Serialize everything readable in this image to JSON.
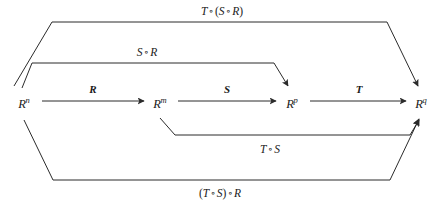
{
  "diagram": {
    "background_color": "#ffffff",
    "stroke_color": "#2b2b2b",
    "nodes": [
      {
        "id": "n1",
        "symbol": "R",
        "superscript": "n",
        "x": 24,
        "y": 103
      },
      {
        "id": "n2",
        "symbol": "R",
        "superscript": "m",
        "x": 160,
        "y": 103
      },
      {
        "id": "n3",
        "symbol": "R",
        "superscript": "p",
        "x": 292,
        "y": 103
      },
      {
        "id": "n4",
        "symbol": "R",
        "superscript": "q",
        "x": 421,
        "y": 103
      }
    ],
    "arrows": [
      {
        "id": "a1",
        "label": "R",
        "x": 93,
        "y": 89
      },
      {
        "id": "a2",
        "label": "S",
        "x": 227,
        "y": 89
      },
      {
        "id": "a3",
        "label": "T",
        "x": 359,
        "y": 89
      }
    ],
    "compositions": [
      {
        "id": "c1",
        "label_parts": {
          "left": "T",
          "op1": "∘",
          "open": "(",
          "mid": "S",
          "op2": "∘",
          "right": "R",
          "close": ")"
        },
        "label_text": "T ∘ (S ∘ R)",
        "x": 222,
        "y": 12
      },
      {
        "id": "c2",
        "label_parts": {
          "left": "S",
          "op1": "∘",
          "right": "R"
        },
        "label_text": "S ∘ R",
        "x": 147,
        "y": 53
      },
      {
        "id": "c3",
        "label_parts": {
          "left": "T",
          "op1": "∘",
          "right": "S"
        },
        "label_text": "T ∘ S",
        "x": 270,
        "y": 150
      },
      {
        "id": "c4",
        "label_parts": {
          "open": "(",
          "left": "T",
          "op1": "∘",
          "mid": "S",
          "close": ")",
          "op2": "∘",
          "right": "R"
        },
        "label_text": "(T ∘ S) ∘ R",
        "x": 220,
        "y": 194
      }
    ]
  }
}
